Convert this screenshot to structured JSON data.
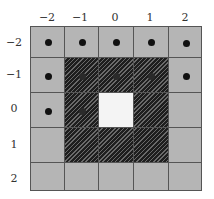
{
  "columns": [
    "−2",
    "−1",
    "0",
    "1",
    "2"
  ],
  "rows": [
    "−2",
    "−1",
    "0",
    "1",
    "2"
  ],
  "colors": {
    "cell": "#b5b5b5",
    "grid_line": "#555555",
    "hatch_dark": "#1e1e1e",
    "hatch_light": "#6a6a6a",
    "center": "#f4f4f4",
    "dot": "#111111"
  },
  "hatched_region": {
    "cols": [
      -1,
      1
    ],
    "rows": [
      -1,
      1
    ]
  },
  "center_cell": {
    "col": 0,
    "row": 0
  },
  "dots": [
    {
      "col": -2,
      "row": -2
    },
    {
      "col": -1,
      "row": -2
    },
    {
      "col": 0,
      "row": -2
    },
    {
      "col": 1,
      "row": -2
    },
    {
      "col": 2,
      "row": -2
    },
    {
      "col": -2,
      "row": -1
    },
    {
      "col": -1,
      "row": -1
    },
    {
      "col": 0,
      "row": -1
    },
    {
      "col": 1,
      "row": -1
    },
    {
      "col": 2,
      "row": -1
    },
    {
      "col": -2,
      "row": 0
    },
    {
      "col": -1,
      "row": 0
    }
  ]
}
